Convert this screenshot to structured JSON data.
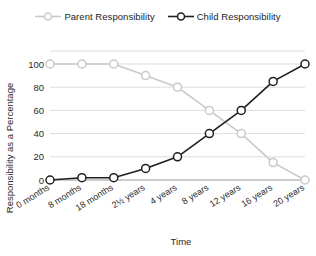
{
  "chart_data": {
    "type": "line",
    "title": "",
    "xlabel": "Time",
    "ylabel": "Responsibility as a Percentage",
    "categories": [
      "0 months",
      "8 months",
      "18 months",
      "2½ years",
      "4 years",
      "8 years",
      "12 years",
      "16 years",
      "20 years"
    ],
    "series": [
      {
        "name": "Parent Responsibility",
        "color": "#c9c9c9",
        "marker": "open-circle",
        "values": [
          100,
          100,
          100,
          90,
          80,
          60,
          40,
          15,
          0
        ]
      },
      {
        "name": "Child Responsibility",
        "color": "#1f1f1f",
        "marker": "open-circle",
        "values": [
          0,
          2,
          2,
          10,
          20,
          40,
          60,
          85,
          100
        ]
      }
    ],
    "ylim": [
      0,
      100
    ],
    "yticks": [
      0,
      20,
      40,
      60,
      80,
      100
    ],
    "ytick_labels": [
      "0",
      "20",
      "40",
      "60",
      "80",
      "100"
    ],
    "grid": true,
    "grid_axis": "y",
    "legend_position": "top-center"
  },
  "legend": {
    "entries": [
      {
        "label": "Parent Responsibility"
      },
      {
        "label": "Child Responsibility"
      }
    ]
  },
  "axes": {
    "y_title": "Responsibility as a Percentage",
    "x_title": "Time"
  },
  "colors": {
    "parent": "#c9c9c9",
    "child": "#1f1f1f",
    "grid": "#d4d4d4",
    "axis": "#9a9a9a",
    "background": "#ffffff",
    "text": "#2b2b2b"
  }
}
